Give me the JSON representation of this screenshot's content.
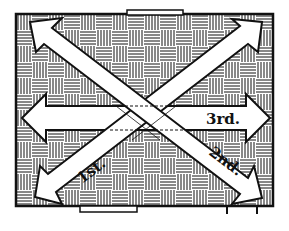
{
  "diagram": {
    "room": {
      "x": 16,
      "y": 14,
      "width": 257,
      "height": 192,
      "floor_pattern": "basket-weave parquet"
    },
    "colors": {
      "line": "#111111",
      "background": "#ffffff",
      "arrow_fill": "#ffffff"
    },
    "openings": [
      {
        "name": "top-window",
        "x": 127,
        "y": 10,
        "width": 56,
        "height": 5
      },
      {
        "name": "bottom-door",
        "x": 80,
        "y": 206,
        "width": 57,
        "height": 6
      }
    ],
    "arrows": [
      {
        "id": "first",
        "label": "1st.",
        "from": [
          262,
          22
        ],
        "to": [
          35,
          197
        ],
        "double_headed": true
      },
      {
        "id": "second",
        "label": "2nd.",
        "from": [
          30,
          22
        ],
        "to": [
          262,
          198
        ],
        "double_headed": true
      },
      {
        "id": "third",
        "label": "3rd.",
        "from": [
          22,
          118
        ],
        "to": [
          270,
          118
        ],
        "double_headed": true
      }
    ]
  }
}
